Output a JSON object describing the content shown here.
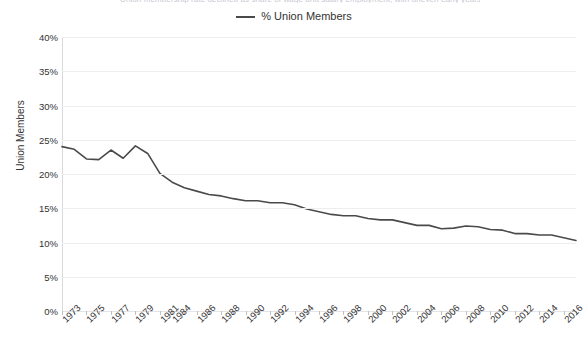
{
  "title_clipped": "Union membership rate declined as share of wage and salary employment, with uneven early years",
  "legend": {
    "entries": [
      {
        "label": "% Union Members",
        "color": "#4a4a4a",
        "marker": "line-swatch"
      }
    ]
  },
  "axes": {
    "y_title": "Union Members",
    "y_ticks": [
      "0%",
      "5%",
      "10%",
      "15%",
      "20%",
      "25%",
      "30%",
      "35%",
      "40%"
    ],
    "x_tick_labels": [
      "1973",
      "1975",
      "1977",
      "1979",
      "1981",
      "1984",
      "1986",
      "1988",
      "1990",
      "1992",
      "1994",
      "1996",
      "1998",
      "2000",
      "2002",
      "2004",
      "2006",
      "2008",
      "2010",
      "2012",
      "2014",
      "2016"
    ]
  },
  "chart_data": {
    "type": "line",
    "title": "",
    "xlabel": "",
    "ylabel": "Union Members",
    "ylim": [
      0,
      40
    ],
    "ytick_step": 5,
    "grid": true,
    "legend_position": "top-center",
    "line_color": "#4a4a4a",
    "line_width": 1.6,
    "x": [
      1973,
      1974,
      1975,
      1976,
      1977,
      1978,
      1979,
      1980,
      1981,
      1984,
      1985,
      1986,
      1987,
      1988,
      1989,
      1990,
      1991,
      1992,
      1993,
      1994,
      1995,
      1996,
      1997,
      1998,
      1999,
      2000,
      2001,
      2002,
      2003,
      2004,
      2005,
      2006,
      2007,
      2008,
      2009,
      2010,
      2011,
      2012,
      2013,
      2014,
      2015,
      2016,
      2017
    ],
    "series": [
      {
        "name": "% Union Members",
        "values": [
          24.0,
          23.6,
          22.2,
          22.1,
          23.5,
          22.3,
          24.1,
          23.0,
          20.1,
          18.8,
          18.0,
          17.5,
          17.0,
          16.8,
          16.4,
          16.1,
          16.1,
          15.8,
          15.8,
          15.5,
          14.9,
          14.5,
          14.1,
          13.9,
          13.9,
          13.5,
          13.3,
          13.3,
          12.9,
          12.5,
          12.5,
          12.0,
          12.1,
          12.4,
          12.3,
          11.9,
          11.8,
          11.3,
          11.3,
          11.1,
          11.1,
          10.7,
          10.3
        ]
      }
    ],
    "annotations": []
  }
}
